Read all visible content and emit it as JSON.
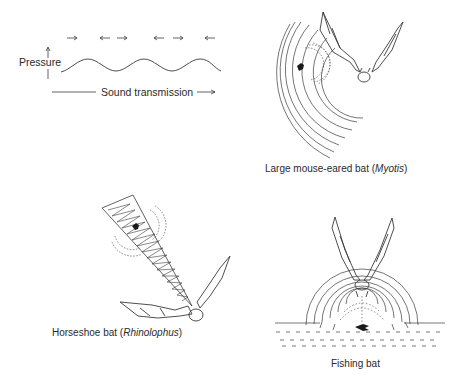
{
  "wave_panel": {
    "pressure_label": "Pressure",
    "transmission_label": "Sound transmission",
    "particle_arrows": [
      "right",
      "left",
      "right",
      "left",
      "right",
      "left"
    ]
  },
  "panels": [
    {
      "id": "myotis",
      "label_common": "Large mouse-eared bat (",
      "label_genus": "Myotis",
      "label_close": ")"
    },
    {
      "id": "rhinolophus",
      "label_common": "Horseshoe bat (",
      "label_genus": "Rhinolophus",
      "label_close": ")"
    },
    {
      "id": "fishing",
      "label_common": "Fishing bat",
      "label_genus": "",
      "label_close": ""
    }
  ],
  "colors": {
    "ink": "#3a3a3a",
    "text": "#2a2a2a",
    "background": "#ffffff"
  }
}
